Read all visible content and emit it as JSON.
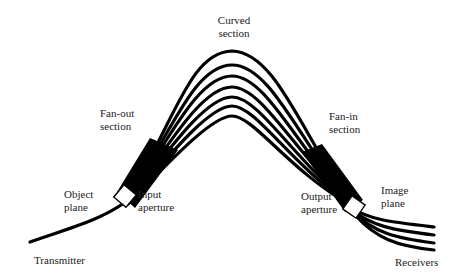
{
  "diagram": {
    "type": "fiber-optic bundle (curved imaging guide)",
    "fiber_count_curved": 7,
    "fiber_count_receivers": 4,
    "colors": {
      "fiber": "#000000",
      "background": "#ffffff",
      "aperture_fill": "#ffffff"
    }
  },
  "labels": {
    "curved_section": "Curved\nsection",
    "fan_out_section": "Fan-out\nsection",
    "fan_in_section": "Fan-in\nsection",
    "object_plane": "Object\nplane",
    "input_aperture": "Input\naperture",
    "output_aperture": "Output\naperture",
    "image_plane": "Image\nplane",
    "transmitter": "Transmitter",
    "receivers": "Receivers"
  }
}
